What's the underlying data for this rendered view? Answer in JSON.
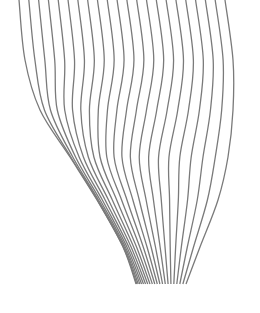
{
  "figure": {
    "line_count": 22,
    "stroke_color": "#7a7a7a",
    "stroke_width": 1.3,
    "background": "#ffffff",
    "rows_y": [
      0,
      60,
      110,
      157,
      200,
      247,
      284
    ],
    "row_extents": [
      {
        "y": 0,
        "x_first": 19,
        "x_last": 225
      },
      {
        "y": 60,
        "x_first": 25,
        "x_last": 233
      },
      {
        "y": 110,
        "x_first": 40,
        "x_last": 233
      },
      {
        "y": 157,
        "x_first": 70,
        "x_last": 228
      },
      {
        "y": 200,
        "x_first": 97,
        "x_last": 218
      },
      {
        "y": 247,
        "x_first": 123,
        "x_last": 200
      },
      {
        "y": 284,
        "x_first": 136,
        "x_last": 186
      }
    ],
    "left_bunching": [
      0,
      0,
      0.15,
      0.45,
      0.55,
      0.5,
      0.2
    ]
  }
}
